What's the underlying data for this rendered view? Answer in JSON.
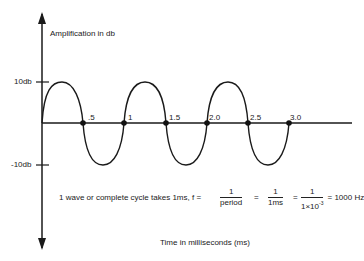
{
  "diagram": {
    "y_axis_label": "Amplification in db",
    "x_axis_label": "Time in milliseconds (ms)",
    "y_ticks": [
      {
        "label": "10db",
        "value": 10
      },
      {
        "label": "-10db",
        "value": -10
      }
    ],
    "x_ticks": [
      ".5",
      "1",
      "1.5",
      "2.0",
      "2.5",
      "3.0"
    ],
    "colors": {
      "line": "#1a1a1a",
      "background": "#ffffff"
    }
  },
  "formula": {
    "prefix": "1 wave or complete cycle takes 1ms, f =",
    "frac1_num": "1",
    "frac1_den": "period",
    "eq1": "=",
    "frac2_num": "1",
    "frac2_den": "1ms",
    "eq2": "=",
    "frac3_num": "1",
    "frac3_den_base": "1×10",
    "frac3_den_exp": "-3",
    "result": "= 1000 Hz"
  },
  "chart_data": {
    "type": "line",
    "title": "",
    "xlabel": "Time in milliseconds (ms)",
    "ylabel": "Amplification in db",
    "series": [
      {
        "name": "sine wave",
        "function": "10*sin(2*pi*t/1ms)",
        "x": [
          0,
          0.25,
          0.5,
          0.75,
          1.0,
          1.25,
          1.5,
          1.75,
          2.0,
          2.25,
          2.5,
          2.75,
          3.0
        ],
        "y": [
          0,
          10,
          0,
          -10,
          0,
          10,
          0,
          -10,
          0,
          10,
          0,
          -10,
          0
        ]
      }
    ],
    "marked_points": [
      0.5,
      1.0,
      1.5,
      2.0,
      2.5,
      3.0
    ],
    "ylim": [
      -10,
      10
    ],
    "xlim": [
      0,
      3.0
    ],
    "frequency_hz": 1000,
    "period_ms": 1
  }
}
